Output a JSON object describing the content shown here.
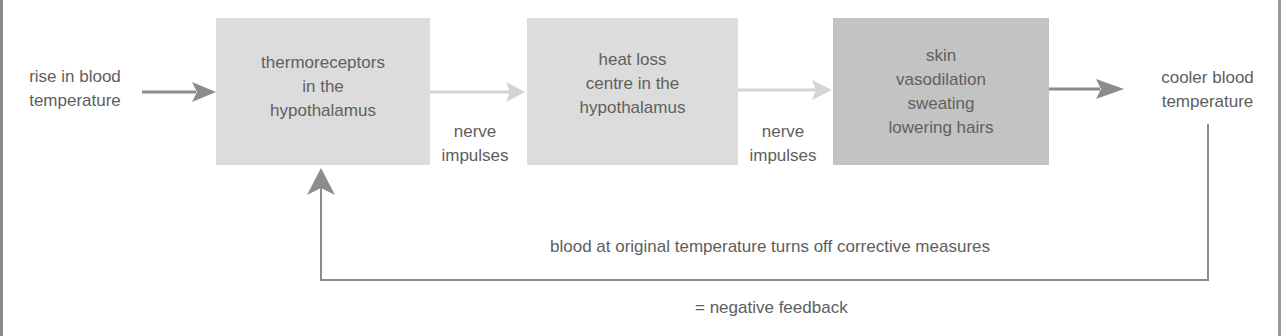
{
  "diagram": {
    "input_label": [
      "rise in blood",
      "temperature"
    ],
    "boxes": [
      {
        "id": "thermoreceptors",
        "lines": [
          "thermoreceptors",
          "in the",
          "hypothalamus"
        ],
        "fill": "#dcdcdc"
      },
      {
        "id": "heat-loss-centre",
        "lines": [
          "heat loss",
          "centre in the",
          "hypothalamus"
        ],
        "fill": "#dcdcdc"
      },
      {
        "id": "effectors",
        "lines": [
          "skin",
          "vasodilation",
          "sweating",
          "lowering hairs"
        ],
        "fill": "#c3c3c3"
      }
    ],
    "connectors": [
      {
        "from": "input",
        "to": "thermoreceptors",
        "label": []
      },
      {
        "from": "thermoreceptors",
        "to": "heat-loss-centre",
        "label": [
          "nerve",
          "impulses"
        ]
      },
      {
        "from": "heat-loss-centre",
        "to": "effectors",
        "label": [
          "nerve",
          "impulses"
        ]
      },
      {
        "from": "effectors",
        "to": "output",
        "label": []
      }
    ],
    "output_label": [
      "cooler blood",
      "temperature"
    ],
    "feedback_label": "blood at original temperature turns off corrective measures",
    "caption": "= negative feedback",
    "colors": {
      "arrow_dark": "#8c8c8c",
      "arrow_light": "#d4d4d4",
      "text": "#5e5e5e"
    }
  }
}
